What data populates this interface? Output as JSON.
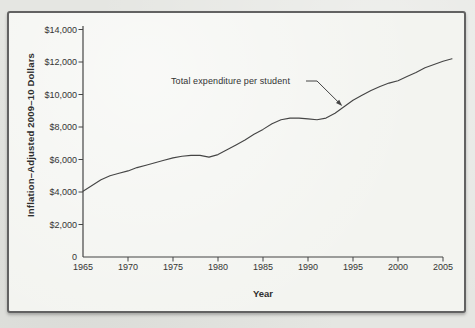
{
  "page": {
    "background_color": "#e5e6e2",
    "frame_background_color": "#f3f4f0",
    "frame_border_color": "#626262"
  },
  "chart_data": {
    "type": "line",
    "title": "",
    "xlabel": "Year",
    "ylabel": "Inflation–Adjusted 2009–10 Dollars",
    "legend_position": "none",
    "grid": false,
    "line_color": "#454545",
    "axis_color": "#454545",
    "xlim": [
      1965,
      2005
    ],
    "ylim": [
      0,
      14000
    ],
    "x_ticks": [
      1965,
      1970,
      1975,
      1980,
      1985,
      1990,
      1995,
      2000,
      2005
    ],
    "y_ticks": [
      0,
      2000,
      4000,
      6000,
      8000,
      10000,
      12000,
      14000
    ],
    "y_tick_labels": [
      "0",
      "$2,000",
      "$4,000",
      "$6,000",
      "$8,000",
      "$10,000",
      "$12,000",
      "$14,000"
    ],
    "annotation": {
      "label": "Total expenditure per student",
      "points_to": {
        "x": 1993.8,
        "y": 9300
      }
    },
    "x": [
      1965,
      1966,
      1967,
      1968,
      1969,
      1970,
      1971,
      1972,
      1973,
      1974,
      1975,
      1976,
      1977,
      1978,
      1979,
      1980,
      1981,
      1982,
      1983,
      1984,
      1985,
      1986,
      1987,
      1988,
      1989,
      1990,
      1991,
      1992,
      1993,
      1994,
      1995,
      1996,
      1997,
      1998,
      1999,
      2000,
      2001,
      2002,
      2003,
      2004,
      2005,
      2006
    ],
    "series": [
      {
        "name": "Total expenditure per student",
        "values": [
          4050,
          4400,
          4750,
          5000,
          5150,
          5300,
          5500,
          5650,
          5800,
          5950,
          6100,
          6200,
          6250,
          6250,
          6150,
          6300,
          6600,
          6900,
          7200,
          7550,
          7850,
          8200,
          8450,
          8550,
          8550,
          8500,
          8450,
          8550,
          8850,
          9250,
          9650,
          9950,
          10250,
          10500,
          10700,
          10850,
          11100,
          11350,
          11650,
          11850,
          12050,
          12200
        ]
      }
    ]
  }
}
